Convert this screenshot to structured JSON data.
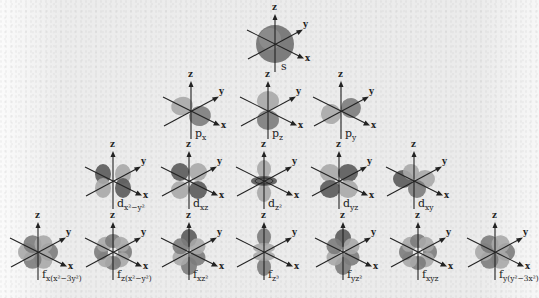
{
  "diagram": {
    "title": "",
    "background_color": "#ececec",
    "lobe_colors": {
      "dark": "#5a5a5a",
      "mid": "#7c7c7c",
      "light": "#a8a8a8"
    },
    "axis_color": "#222222",
    "axis_labels": {
      "x": "x",
      "y": "y",
      "z": "z"
    },
    "rows": [
      {
        "name": "s-row",
        "orbitals": [
          {
            "id": "s",
            "label_main": "s",
            "label_sub": "",
            "cx": 275,
            "cy": 44,
            "shape": "sphere"
          }
        ]
      },
      {
        "name": "p-row",
        "orbitals": [
          {
            "id": "px",
            "label_main": "p",
            "label_sub": "x",
            "cx": 191,
            "cy": 111,
            "shape": "px"
          },
          {
            "id": "pz",
            "label_main": "p",
            "label_sub": "z",
            "cx": 268,
            "cy": 111,
            "shape": "pz"
          },
          {
            "id": "py",
            "label_main": "p",
            "label_sub": "y",
            "cx": 341,
            "cy": 111,
            "shape": "py"
          }
        ]
      },
      {
        "name": "d-row",
        "orbitals": [
          {
            "id": "dx2-y2",
            "label_main": "d",
            "label_sub": "x²−y²",
            "cx": 113,
            "cy": 181,
            "shape": "dx2y2"
          },
          {
            "id": "dxz",
            "label_main": "d",
            "label_sub": "xz",
            "cx": 189,
            "cy": 181,
            "shape": "dxz"
          },
          {
            "id": "dz2",
            "label_main": "d",
            "label_sub": "z²",
            "cx": 264,
            "cy": 181,
            "shape": "dz2"
          },
          {
            "id": "dyz",
            "label_main": "d",
            "label_sub": "yz",
            "cx": 339,
            "cy": 181,
            "shape": "dyz"
          },
          {
            "id": "dxy",
            "label_main": "d",
            "label_sub": "xy",
            "cx": 414,
            "cy": 181,
            "shape": "dxy"
          }
        ]
      },
      {
        "name": "f-row",
        "orbitals": [
          {
            "id": "fx(x2-3y2)",
            "label_main": "f",
            "label_sub": "x(x²−3y²)",
            "cx": 38,
            "cy": 252,
            "shape": "f6"
          },
          {
            "id": "fz(x2-y2)",
            "label_main": "f",
            "label_sub": "z(x²−y²)",
            "cx": 113,
            "cy": 252,
            "shape": "f8"
          },
          {
            "id": "fxz2",
            "label_main": "f",
            "label_sub": "xz²",
            "cx": 189,
            "cy": 252,
            "shape": "f6b"
          },
          {
            "id": "fz3",
            "label_main": "f",
            "label_sub": "z³",
            "cx": 264,
            "cy": 252,
            "shape": "fz3"
          },
          {
            "id": "fyz2",
            "label_main": "f",
            "label_sub": "yz²",
            "cx": 343,
            "cy": 252,
            "shape": "f6b"
          },
          {
            "id": "fxyz",
            "label_main": "f",
            "label_sub": "xyz",
            "cx": 418,
            "cy": 252,
            "shape": "f8"
          },
          {
            "id": "fy(y2-3x2)",
            "label_main": "f",
            "label_sub": "y(y²−3x²)",
            "cx": 495,
            "cy": 252,
            "shape": "f6"
          }
        ]
      }
    ]
  }
}
